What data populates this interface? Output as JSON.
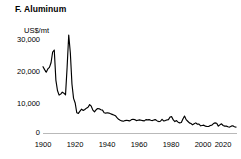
{
  "chart_data": {
    "type": "line",
    "title": "F. Aluminum",
    "panel_letter": "F.",
    "commodity": "Aluminum",
    "xlabel": "",
    "ylabel": "US$/mt",
    "ylabel_position": "above-axis",
    "xlim": [
      1900,
      2020
    ],
    "ylim": [
      0,
      30000
    ],
    "ytick_labels": [
      "30,000",
      "20,000",
      "10,000",
      "0"
    ],
    "ytick_values": [
      30000,
      20000,
      10000,
      0
    ],
    "xtick_labels": [
      "1900",
      "1920",
      "1940",
      "1960",
      "1980",
      "2000",
      "2020"
    ],
    "xtick_values": [
      1900,
      1920,
      1940,
      1960,
      1980,
      2000,
      2020
    ],
    "grid": false,
    "legend": null,
    "line_color": "#000000",
    "axis_color": "#b9b9b9",
    "units": "US$/mt",
    "x": [
      1900,
      1901,
      1902,
      1903,
      1904,
      1905,
      1906,
      1907,
      1908,
      1909,
      1910,
      1911,
      1912,
      1913,
      1914,
      1915,
      1916,
      1917,
      1918,
      1919,
      1920,
      1921,
      1922,
      1923,
      1924,
      1925,
      1926,
      1927,
      1928,
      1929,
      1930,
      1931,
      1932,
      1933,
      1934,
      1935,
      1936,
      1937,
      1938,
      1939,
      1940,
      1941,
      1942,
      1943,
      1944,
      1945,
      1946,
      1947,
      1948,
      1949,
      1950,
      1951,
      1952,
      1953,
      1954,
      1955,
      1956,
      1957,
      1958,
      1959,
      1960,
      1961,
      1962,
      1963,
      1964,
      1965,
      1966,
      1967,
      1968,
      1969,
      1970,
      1971,
      1972,
      1973,
      1974,
      1975,
      1976,
      1977,
      1978,
      1979,
      1980,
      1981,
      1982,
      1983,
      1984,
      1985,
      1986,
      1987,
      1988,
      1989,
      1990,
      1991,
      1992,
      1993,
      1994,
      1995,
      1996,
      1997,
      1998,
      1999,
      2000,
      2001,
      2002,
      2003,
      2004,
      2005,
      2006,
      2007,
      2008,
      2009,
      2010,
      2011,
      2012,
      2013,
      2014,
      2015,
      2016,
      2017,
      2018,
      2019,
      2020
    ],
    "values": [
      20300,
      19400,
      18600,
      19600,
      20100,
      21500,
      24800,
      25400,
      16200,
      13000,
      11600,
      11900,
      12500,
      12200,
      11700,
      20200,
      30000,
      24500,
      15000,
      10600,
      9200,
      6200,
      6000,
      6700,
      7300,
      6900,
      7200,
      7600,
      7900,
      8700,
      8200,
      7000,
      6500,
      7100,
      7500,
      7400,
      7100,
      7000,
      6200,
      6100,
      6200,
      6100,
      5900,
      5700,
      5500,
      5300,
      4700,
      4200,
      3900,
      3700,
      3600,
      3800,
      3900,
      3800,
      3700,
      4100,
      4200,
      4100,
      3800,
      3900,
      4000,
      3900,
      3800,
      3700,
      4100,
      4000,
      4100,
      3900,
      3800,
      4000,
      4100,
      3700,
      3500,
      3600,
      4200,
      3700,
      3800,
      4000,
      4100,
      4900,
      5000,
      4000,
      3500,
      3800,
      3300,
      3100,
      3200,
      4300,
      5200,
      4100,
      3600,
      3100,
      2900,
      2500,
      2800,
      3100,
      2700,
      2700,
      2200,
      2300,
      2400,
      2100,
      2000,
      2000,
      2300,
      2400,
      2900,
      3100,
      3000,
      2100,
      2500,
      2800,
      2300,
      2100,
      2100,
      1900,
      1800,
      2100,
      2200,
      1900,
      1800
    ]
  }
}
